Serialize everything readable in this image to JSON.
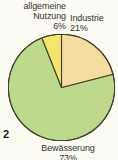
{
  "figure": {
    "number": "2"
  },
  "labels": {
    "general_use": {
      "line1": "allgemeine",
      "line2": "Nutzung",
      "value": "6%"
    },
    "industry": {
      "line1": "Industrie",
      "value": "21%"
    },
    "irrigation": {
      "line1": "Bewässerung",
      "value": "73%"
    }
  },
  "chart_data": {
    "type": "pie",
    "title": "",
    "categories": [
      "Bewässerung",
      "Industrie",
      "allgemeine Nutzung"
    ],
    "values": [
      73,
      21,
      6
    ],
    "unit": "%",
    "labels": [
      "Bewässerung 73%",
      "Industrie 21%",
      "allgemeine Nutzung 6%"
    ],
    "colors": [
      "#bcd98c",
      "#f3dea0",
      "#f6e46a"
    ],
    "start_angle_deg": 0,
    "direction": "clockwise",
    "legend": "none",
    "data_labels": true,
    "stroke_color": "#3f3f2e",
    "background": "#fcfbf2"
  },
  "colors": {
    "slice_irrigation": "#bcd98c",
    "slice_industry": "#f3dea0",
    "slice_general": "#f6e46a",
    "outline": "#3f3f2e",
    "text": "#33322b",
    "background": "#fcfbf2"
  }
}
